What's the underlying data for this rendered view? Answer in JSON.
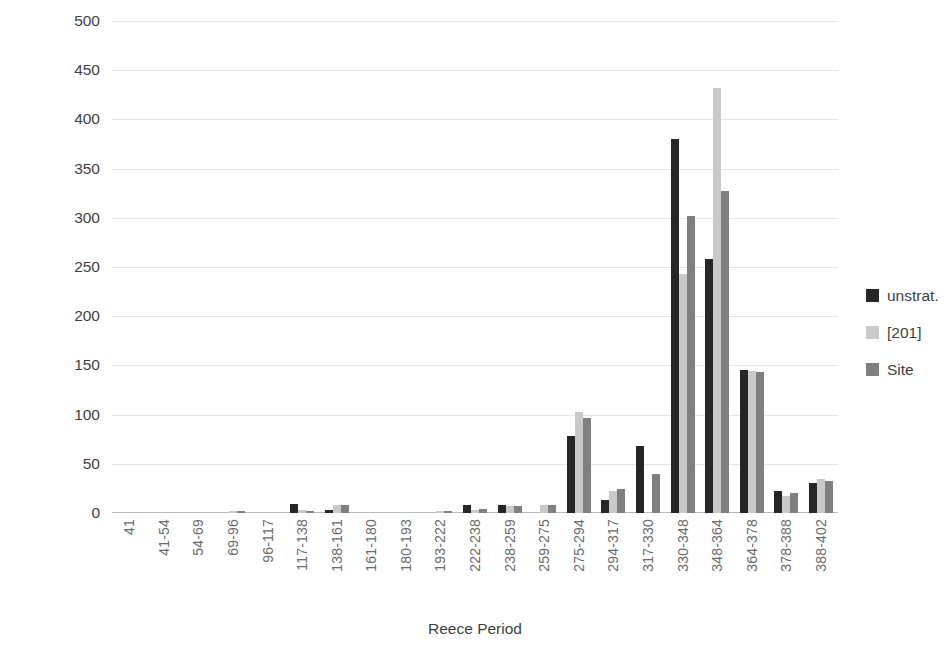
{
  "chart_data": {
    "type": "bar",
    "title": "",
    "xlabel": "Reece Period",
    "ylabel": "% per mills",
    "ylim": [
      0,
      500
    ],
    "ytick_step": 50,
    "yticks": [
      500,
      450,
      400,
      350,
      300,
      250,
      200,
      150,
      100,
      50,
      0
    ],
    "grid": true,
    "legend_position": "right",
    "categories": [
      "41",
      "41-54",
      "54-69",
      "69-96",
      "96-117",
      "117-138",
      "138-161",
      "161-180",
      "180-193",
      "193-222",
      "222-238",
      "238-259",
      "259-275",
      "275-294",
      "294-317",
      "317-330",
      "330-348",
      "348-364",
      "364-378",
      "378-388",
      "388-402"
    ],
    "series": [
      {
        "name": "unstrat.",
        "color": "#262626",
        "values": [
          0,
          0,
          0,
          0,
          0,
          9,
          3,
          0,
          0,
          0,
          8,
          8,
          0,
          78,
          13,
          68,
          380,
          258,
          145,
          22,
          30
        ]
      },
      {
        "name": "[201]",
        "color": "#c9c9c9",
        "values": [
          0,
          0,
          0,
          2,
          0,
          3,
          8,
          0,
          0,
          2,
          3,
          7,
          8,
          103,
          22,
          0,
          243,
          432,
          144,
          17,
          35
        ]
      },
      {
        "name": "Site",
        "color": "#7f7f7f",
        "values": [
          0,
          0,
          0,
          2,
          0,
          2,
          8,
          0,
          0,
          2,
          4,
          7,
          8,
          97,
          24,
          40,
          302,
          327,
          143,
          20,
          33
        ]
      }
    ]
  },
  "legend": {
    "items": [
      {
        "label": "unstrat.",
        "color": "#262626"
      },
      {
        "label": "[201]",
        "color": "#c9c9c9"
      },
      {
        "label": "Site",
        "color": "#7f7f7f"
      }
    ]
  }
}
